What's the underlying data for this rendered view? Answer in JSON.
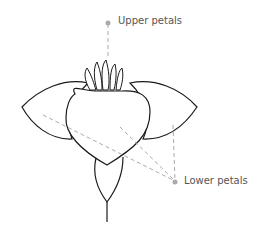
{
  "labels": {
    "upper": "Upper petals",
    "lower": "Lower petals"
  },
  "colors": {
    "outline": "#1a1a1a",
    "leader": "#aaaaaa",
    "text": "#555555"
  }
}
